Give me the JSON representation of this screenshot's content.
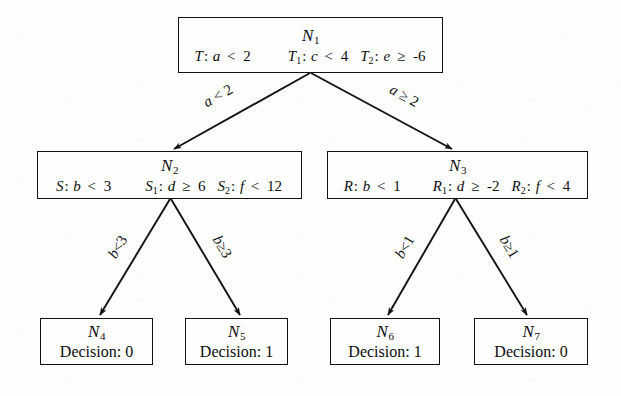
{
  "figure": {
    "type": "decision-tree",
    "background_color": "#fdfdfc",
    "ink_color": "#121212"
  },
  "nodes": {
    "n1": {
      "id": "N",
      "index": "1",
      "rules": [
        {
          "name": "T",
          "sub": "",
          "var": "a",
          "op": "<",
          "value": "2"
        },
        {
          "name": "T",
          "sub": "1",
          "var": "c",
          "op": "<",
          "value": "4"
        },
        {
          "name": "T",
          "sub": "2",
          "var": "e",
          "op": "≥",
          "value": "-6"
        }
      ]
    },
    "n2": {
      "id": "N",
      "index": "2",
      "rules": [
        {
          "name": "S",
          "sub": "",
          "var": "b",
          "op": "<",
          "value": "3"
        },
        {
          "name": "S",
          "sub": "1",
          "var": "d",
          "op": "≥",
          "value": "6"
        },
        {
          "name": "S",
          "sub": "2",
          "var": "f",
          "op": "<",
          "value": "12"
        }
      ]
    },
    "n3": {
      "id": "N",
      "index": "3",
      "rules": [
        {
          "name": "R",
          "sub": "",
          "var": "b",
          "op": "<",
          "value": "1"
        },
        {
          "name": "R",
          "sub": "1",
          "var": "d",
          "op": "≥",
          "value": "-2"
        },
        {
          "name": "R",
          "sub": "2",
          "var": "f",
          "op": "<",
          "value": "4"
        }
      ]
    },
    "n4": {
      "id": "N",
      "index": "4",
      "decision_label": "Decision: 0"
    },
    "n5": {
      "id": "N",
      "index": "5",
      "decision_label": "Decision: 1"
    },
    "n6": {
      "id": "N",
      "index": "6",
      "decision_label": "Decision: 1"
    },
    "n7": {
      "id": "N",
      "index": "7",
      "decision_label": "Decision: 0"
    }
  },
  "edges": [
    {
      "key": "n1-n2",
      "from": "n1",
      "to": "n2",
      "label": "a < 2",
      "var": "a",
      "op": "<",
      "value": "2"
    },
    {
      "key": "n1-n3",
      "from": "n1",
      "to": "n3",
      "label": "a ≥ 2",
      "var": "a",
      "op": "≥",
      "value": "2"
    },
    {
      "key": "n2-n4",
      "from": "n2",
      "to": "n4",
      "label": "b<3",
      "var": "b",
      "op": "<",
      "value": "3"
    },
    {
      "key": "n2-n5",
      "from": "n2",
      "to": "n5",
      "label": "b ≥ 3",
      "var": "b",
      "op": "≥",
      "value": "3"
    },
    {
      "key": "n3-n6",
      "from": "n3",
      "to": "n6",
      "label": "b<1",
      "var": "b",
      "op": "<",
      "value": "1"
    },
    {
      "key": "n3-n7",
      "from": "n3",
      "to": "n7",
      "label": "b ≥ 1",
      "var": "b",
      "op": "≥",
      "value": "1"
    }
  ],
  "edge_labels": {
    "n1_n2": {
      "var": "a",
      "op": "<",
      "value": "2"
    },
    "n1_n3": {
      "var": "a",
      "op": "≥",
      "value": "2"
    },
    "n2_n4": {
      "var": "b",
      "op": "<",
      "value": "3"
    },
    "n2_n5": {
      "var": "b",
      "op": "≥",
      "value": "3"
    },
    "n3_n6": {
      "var": "b",
      "op": "<",
      "value": "1"
    },
    "n3_n7": {
      "var": "b",
      "op": "≥",
      "value": "1"
    }
  }
}
